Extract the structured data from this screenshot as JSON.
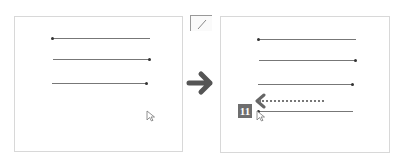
{
  "before_panel": {
    "lines": [
      {
        "x1": 52,
        "x2": 150,
        "y": 38,
        "dot": "left"
      },
      {
        "x1": 53,
        "x2": 150,
        "y": 59,
        "dot": "right"
      },
      {
        "x1": 52,
        "x2": 147,
        "y": 83,
        "dot": "right"
      }
    ],
    "cursor": {
      "x": 146,
      "y": 110
    }
  },
  "corner_icon": "line-tool-icon",
  "transition_icon": "right-arrow-icon",
  "after_panel": {
    "lines": [
      {
        "x1": 258,
        "x2": 356,
        "y": 39,
        "dot": "left"
      },
      {
        "x1": 259,
        "x2": 356,
        "y": 60,
        "dot": "right"
      },
      {
        "x1": 258,
        "x2": 353,
        "y": 84,
        "dot": "right"
      },
      {
        "x1": 258,
        "x2": 353,
        "y": 111,
        "dot": "left"
      }
    ],
    "step_badge": "11",
    "drag_arrow": "left-dotted-arrow-icon",
    "cursor": {
      "x": 257,
      "y": 110
    }
  },
  "colors": {
    "line": "#777777",
    "dot": "#333333",
    "arrow": "#555555",
    "badge": "#6e6e6e",
    "border": "#d8d8d8"
  }
}
